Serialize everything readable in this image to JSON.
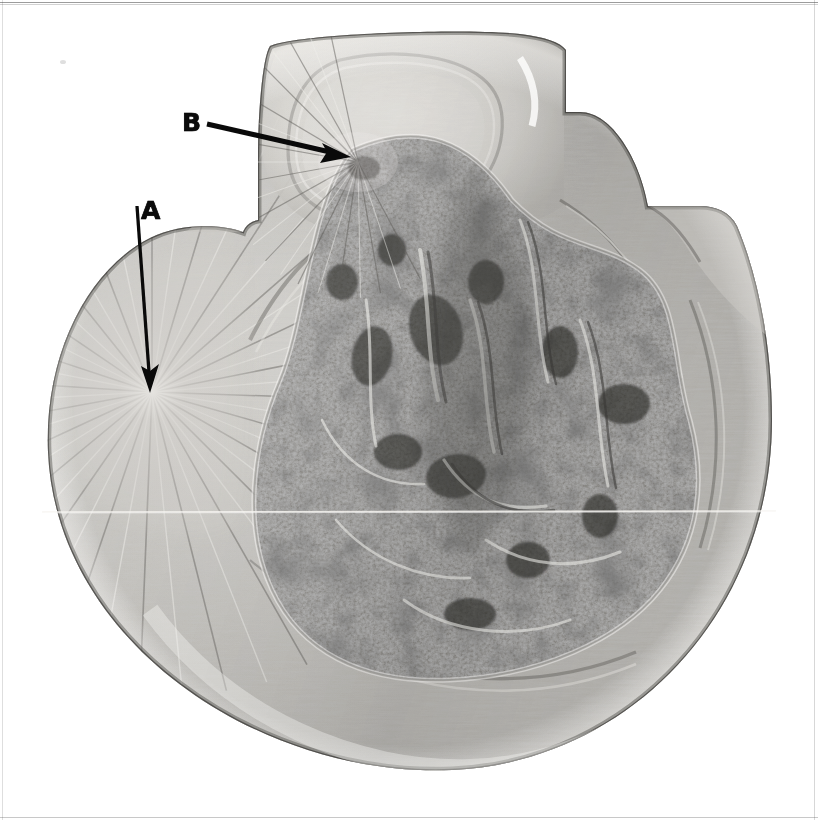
{
  "figure": {
    "kind": "fractograph-micrograph",
    "background_color": "#ffffff",
    "width_px": 818,
    "height_px": 820,
    "border_color": "#4a4a4a",
    "scan_line": {
      "present": true,
      "orientation": "horizontal",
      "y_px": 512,
      "color": "#f4f2ee"
    }
  },
  "annotations": [
    {
      "id": "a",
      "label": "A",
      "label_x": 141,
      "label_y": 198,
      "arrow": {
        "from_x": 137,
        "from_y": 205,
        "to_x": 150,
        "to_y": 391,
        "color": "#0a0a0a",
        "shaft_width": 3.2,
        "head_length": 26,
        "head_width": 15,
        "direction": "down"
      },
      "points_to": "radial fracture origin / starburst on left flank"
    },
    {
      "id": "b",
      "label": "B",
      "label_x": 182,
      "label_y": 110,
      "arrow": {
        "from_x": 207,
        "from_y": 124,
        "to_x": 350,
        "to_y": 157,
        "color": "#0a0a0a",
        "shaft_width": 5.0,
        "head_length": 30,
        "head_width": 17,
        "direction": "down-right"
      },
      "points_to": "second fracture origin in upper boss / shoulder region"
    }
  ],
  "specimen": {
    "outline_description": "near-circular fracture face with a raised rectangular boss at top-centre and a stepped shoulder notch on the right",
    "tone_light": "#e8e6e2",
    "tone_mid": "#a8a6a2",
    "tone_dark": "#3a3a38",
    "regions": [
      {
        "name": "smooth-radial-zone",
        "label": "fine radial / fatigue zone (left)",
        "texture": "fine radial striations",
        "mean_tone": "#b9b7b2"
      },
      {
        "name": "coarse-fibrous-zone",
        "label": "coarse granular overload zone (centre-right)",
        "texture": "coarse high-contrast granular",
        "mean_tone": "#6e6c68"
      },
      {
        "name": "upper-boss",
        "label": "upper boss / raised land",
        "texture": "smooth with concentric ridge",
        "mean_tone": "#cfcdc8"
      },
      {
        "name": "shear-lip",
        "label": "shear lip / rim",
        "texture": "bright rim shear",
        "mean_tone": "#dedcd7"
      }
    ]
  }
}
